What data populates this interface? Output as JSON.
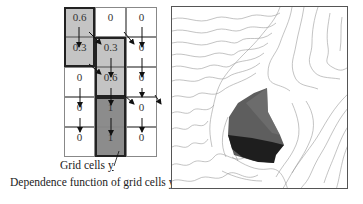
{
  "figure": {
    "grid": {
      "rows": 5,
      "cols": 3,
      "cells": [
        [
          {
            "value": "0.6",
            "shade": "light"
          },
          {
            "value": "0",
            "shade": "none"
          },
          {
            "value": "0",
            "shade": "none"
          }
        ],
        [
          {
            "value": "0.3",
            "shade": "light"
          },
          {
            "value": "0.3",
            "shade": "light"
          },
          {
            "value": "0",
            "shade": "none"
          }
        ],
        [
          {
            "value": "0",
            "shade": "none"
          },
          {
            "value": "0.6",
            "shade": "light"
          },
          {
            "value": "0",
            "shade": "none"
          }
        ],
        [
          {
            "value": "0",
            "shade": "none"
          },
          {
            "value": "1",
            "shade": "dark"
          },
          {
            "value": "0",
            "shade": "none"
          }
        ],
        [
          {
            "value": "0",
            "shade": "none"
          },
          {
            "value": "1",
            "shade": "dark"
          },
          {
            "value": "0",
            "shade": "none"
          }
        ]
      ],
      "colors": {
        "light": "#c4c4c4",
        "dark": "#8c8c8c",
        "border": "#888888"
      }
    },
    "labels": {
      "grid_cells_prefix": "Grid cells ",
      "grid_cells_var": "y",
      "dependence_prefix": "Dependence function of grid cells ",
      "dependence_var": "y"
    },
    "map": {
      "description": "contour map with shaded dependent region",
      "region_colors": {
        "upper": "#5e5e5e",
        "lower": "#1e1e1e"
      }
    }
  }
}
